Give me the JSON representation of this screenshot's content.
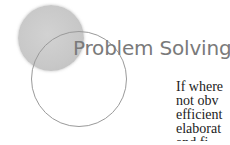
{
  "heading": {
    "title": "Problem Solving"
  },
  "body": {
    "lines": [
      "If where",
      "not obv",
      "efficient",
      "elaborat",
      "and fi"
    ]
  },
  "decoration": {
    "filled_circle_color": "#c8c8c8",
    "outline_circle_color": "#9a9a9a"
  }
}
